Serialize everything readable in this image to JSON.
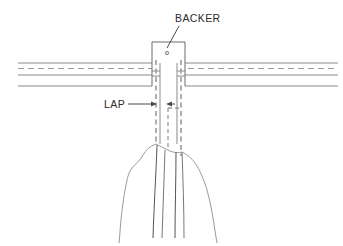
{
  "figure": {
    "type": "technical-drawing",
    "background_color": "#ffffff",
    "line_color_solid": "#8a8a8a",
    "line_color_dark": "#4a4a4a",
    "line_color_dashed": "#9a9a9a",
    "text_color": "#2b2b2b"
  },
  "labels": {
    "backer": "BACKER",
    "lap": "LAP",
    "backer_box_mark": "o"
  },
  "annotations": [
    {
      "id": "backer-callout",
      "text": "BACKER",
      "text_x": 175,
      "text_y": 21,
      "leader_from_x": 178,
      "leader_from_y": 25,
      "leader_to_x": 168,
      "leader_to_y": 47
    },
    {
      "id": "lap-callout",
      "text": "LAP",
      "text_x": 106,
      "text_y": 108,
      "leader_from_x": 130,
      "leader_from_y": 104,
      "leader_to_x": 156,
      "leader_to_y": 104
    }
  ],
  "geometry": {
    "backer_box": {
      "x": 152,
      "y": 42,
      "width": 33,
      "height": 21
    },
    "horizontal_lines": [
      {
        "id": "top-solid-left",
        "x1": 18,
        "y1": 63,
        "x2": 152,
        "y2": 63,
        "style": "solid"
      },
      {
        "id": "top-solid-right",
        "x1": 185,
        "y1": 63,
        "x2": 338,
        "y2": 63,
        "style": "solid"
      },
      {
        "id": "centre-dash-left",
        "x1": 18,
        "y1": 68,
        "x2": 152,
        "y2": 68,
        "style": "dashed"
      },
      {
        "id": "centre-dash-right",
        "x1": 185,
        "y1": 68,
        "x2": 338,
        "y2": 68,
        "style": "dashed"
      },
      {
        "id": "mid-solid-left",
        "x1": 18,
        "y1": 75,
        "x2": 152,
        "y2": 75,
        "style": "solid"
      },
      {
        "id": "mid-solid-right",
        "x1": 185,
        "y1": 75,
        "x2": 338,
        "y2": 75,
        "style": "solid"
      },
      {
        "id": "bottom-solid-left",
        "x1": 18,
        "y1": 86,
        "x2": 152,
        "y2": 86,
        "style": "solid"
      },
      {
        "id": "bottom-solid-right",
        "x1": 185,
        "y1": 86,
        "x2": 338,
        "y2": 86,
        "style": "solid"
      }
    ],
    "vertical_solid_lines": [
      {
        "id": "backer-left-edge",
        "x1": 152,
        "y1": 42,
        "x2": 152,
        "y2": 86
      },
      {
        "id": "backer-right-edge",
        "x1": 185,
        "y1": 42,
        "x2": 185,
        "y2": 86
      },
      {
        "id": "member-left",
        "x1": 160,
        "y1": 63,
        "x2": 160,
        "y2": 143
      },
      {
        "id": "member-right",
        "x1": 177,
        "y1": 63,
        "x2": 177,
        "y2": 143
      }
    ],
    "dashed_vertical_lines": [
      {
        "id": "lap-dash-outer-left",
        "x1": 156,
        "y1": 63,
        "x2": 156,
        "y2": 143
      },
      {
        "id": "lap-dash-inner-left",
        "x1": 167,
        "y1": 105,
        "x2": 167,
        "y2": 147
      },
      {
        "id": "lap-dash-inner-right",
        "x1": 181,
        "y1": 105,
        "x2": 181,
        "y2": 147
      },
      {
        "id": "lap-dash-outer-right",
        "x1": 181,
        "y1": 63,
        "x2": 181,
        "y2": 155
      }
    ],
    "arrows": [
      {
        "id": "lap-arrow-right",
        "tip_x": 156,
        "tip_y": 104,
        "direction": "right"
      },
      {
        "id": "lap-arrow-left",
        "tip_x": 168,
        "tip_y": 104,
        "direction": "left"
      }
    ],
    "break_region": {
      "id": "irregular-break-line",
      "top_y": 143,
      "bottom_y": 240,
      "left_x": 118,
      "right_x": 222
    },
    "grain_lines": [
      {
        "id": "grain-1",
        "x_top": 155,
        "x_bottom": 152
      },
      {
        "id": "grain-2",
        "x_top": 164,
        "x_bottom": 163
      },
      {
        "id": "grain-3",
        "x_top": 176,
        "x_bottom": 175
      },
      {
        "id": "grain-4",
        "x_top": 184,
        "x_bottom": 186
      }
    ]
  }
}
